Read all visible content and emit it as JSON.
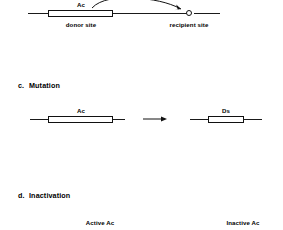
{
  "figure": {
    "background_color": "#ffffff",
    "line_color": "#111111",
    "text_color": "#000000"
  },
  "panels": [
    {
      "id": "transposition",
      "marker": "",
      "heading": "",
      "elements": {
        "element_label": "Ac",
        "donor_label": "donor site",
        "recipient_label": "recipient site"
      }
    },
    {
      "id": "mutation",
      "marker": "c.",
      "heading": "Mutation",
      "elements": {
        "before_label": "Ac",
        "after_label": "Ds"
      }
    },
    {
      "id": "inactivation",
      "marker": "d.",
      "heading": "Inactivation",
      "elements": {
        "active_label": "Active Ac",
        "inactive_label": "Inactive Ac"
      }
    }
  ]
}
